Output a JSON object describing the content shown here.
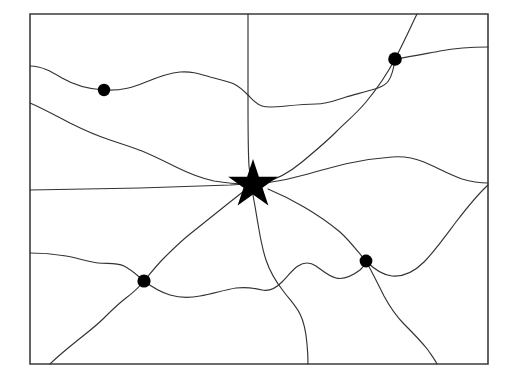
{
  "figure": {
    "type": "outline-map",
    "title": "",
    "background_color": "#ffffff",
    "width": 515,
    "height": 382
  },
  "border": {
    "name": "state-outline",
    "shape": "rectangle",
    "stroke_color": "#3c3c3c",
    "stroke_width": 1.6,
    "left": 30,
    "top": 14,
    "right": 488,
    "bottom": 364,
    "path": "M30,14 L488,14 L488,364 L30,364 Z"
  },
  "capital": {
    "name": "capital-star",
    "marker": "star",
    "fill": "#000000",
    "center_x": 253,
    "center_y": 183,
    "outer_radius": 24,
    "inner_radius": 9.8,
    "path": "M253.0,159.0 L258.9,176.7 L277.8,176.7 L262.5,187.8 L268.4,205.6 L253.0,194.6 L237.6,205.6 L243.5,187.8 L228.2,176.7 L247.1,176.7 Z"
  },
  "cities": [
    {
      "name": "city-dot-northwest",
      "cx": 104,
      "cy": 90,
      "r": 6.2,
      "fill": "#000000"
    },
    {
      "name": "city-dot-northeast",
      "cx": 395,
      "cy": 59,
      "r": 6.8,
      "fill": "#000000"
    },
    {
      "name": "city-dot-southwest",
      "cx": 144,
      "cy": 281,
      "r": 6.6,
      "fill": "#000000"
    },
    {
      "name": "city-dot-southeast",
      "cx": 366,
      "cy": 261,
      "r": 6.4,
      "fill": "#000000"
    }
  ],
  "routes": [
    {
      "name": "route-northwest-horizontal",
      "stroke": "#333333",
      "path": "M30,66 C42,66 52,72 62,78 C74,85 86,89 104,90 C122,91 134,87 146,82 C158,77 168,73 180,72 C192,71 200,74 210,77 C218,79 228,81 234,84 C240,87 244,91 248,95 C252,99 256,104 262,106 C268,108 276,107 286,106 C296,105 306,104 316,104 C328,104 336,100 346,97 C356,94 366,92 378,88 C386,85 392,82 395,59"
    },
    {
      "name": "route-northeast-to-east-border",
      "stroke": "#333333",
      "path": "M395,59 C410,57 424,54 440,51 C456,48 472,47 488,47"
    },
    {
      "name": "route-north-diagonal-northeast",
      "stroke": "#333333",
      "path": "M417,14 C412,24 404,42 395,59 C386,76 376,90 366,102 C356,114 346,122 336,132 C326,142 314,152 302,162 C290,172 276,180 262,183"
    },
    {
      "name": "route-north-vertical",
      "stroke": "#333333",
      "path": "M248,14 C248,40 248,70 248,100 C248,125 248,150 249,166 C250,175 251,180 252,183"
    },
    {
      "name": "route-west-diagonal",
      "stroke": "#333333",
      "path": "M30,103 C44,109 58,117 72,124 C86,131 98,136 110,140 C122,144 132,147 142,151 C154,156 164,161 176,167 C188,173 200,178 214,181 C226,183 238,184 248,184"
    },
    {
      "name": "route-west-straight",
      "stroke": "#333333",
      "path": "M30,190 L140,188 L230,185 L248,184"
    },
    {
      "name": "route-east-upper",
      "stroke": "#333333",
      "path": "M266,183 C280,181 294,178 308,174 C322,170 336,166 350,163 C364,160 378,158 392,157 C404,156 414,158 424,162 C436,167 448,174 462,179 C472,182 480,183 488,183"
    },
    {
      "name": "route-east-lower-to-southeast",
      "stroke": "#333333",
      "path": "M268,189 C280,194 292,200 304,207 C316,214 328,222 340,232 C350,241 358,252 366,261 C374,269 382,275 392,276 C404,277 414,272 424,262 C434,252 444,238 456,222 C466,209 476,196 488,185"
    },
    {
      "name": "route-southeast-to-bottom",
      "stroke": "#333333",
      "path": "M366,261 C372,272 378,284 384,296 C390,307 396,316 404,324 C412,332 420,340 428,350 C432,356 435,360 437,364"
    },
    {
      "name": "route-southwest-wavy-horizontal",
      "stroke": "#333333",
      "path": "M30,253 C42,253 54,254 66,256 C78,258 88,262 98,263 C108,264 116,262 124,266 C132,270 138,276 144,281 C152,287 160,292 170,295 C180,298 190,298 200,296 C212,294 224,290 236,288 C246,287 254,288 262,290 C270,292 276,288 282,282 C288,276 292,270 298,266 C304,262 310,262 316,266 C322,270 328,276 336,278 C344,280 352,276 360,270 C364,266 366,263 366,261"
    },
    {
      "name": "route-southwest-diagonal",
      "stroke": "#333333",
      "path": "M50,364 C58,356 68,348 78,340 C88,332 96,326 104,318 C112,310 118,304 126,298 C134,292 140,286 144,281 C150,274 156,266 164,258 C172,250 180,242 190,234 C200,226 210,218 220,210 C230,202 240,194 248,188"
    },
    {
      "name": "route-south-vertical-wavy",
      "stroke": "#333333",
      "path": "M252,190 C254,200 256,212 258,224 C260,236 262,248 266,260 C270,272 276,282 284,292 C290,300 296,306 300,314 C304,322 306,332 307,344 C308,354 308,360 308,364"
    }
  ]
}
